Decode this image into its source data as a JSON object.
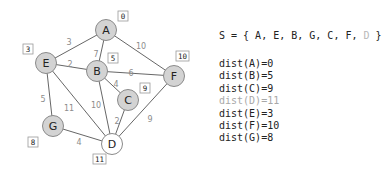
{
  "graph": {
    "nodes": [
      {
        "id": "A",
        "x": 106,
        "y": 30,
        "visited": true,
        "dist_label": "0",
        "lx": 118,
        "ly": 11
      },
      {
        "id": "E",
        "x": 46,
        "y": 63,
        "visited": true,
        "dist_label": "3",
        "lx": 23,
        "ly": 44
      },
      {
        "id": "B",
        "x": 97,
        "y": 71,
        "visited": true,
        "dist_label": "5",
        "lx": 108,
        "ly": 53
      },
      {
        "id": "F",
        "x": 174,
        "y": 76,
        "visited": true,
        "dist_label": "10",
        "lx": 176,
        "ly": 51
      },
      {
        "id": "C",
        "x": 128,
        "y": 100,
        "visited": true,
        "dist_label": "9",
        "lx": 140,
        "ly": 83
      },
      {
        "id": "G",
        "x": 53,
        "y": 126,
        "visited": true,
        "dist_label": "8",
        "lx": 28,
        "ly": 137
      },
      {
        "id": "D",
        "x": 112,
        "y": 144,
        "visited": false,
        "dist_label": "11",
        "lx": 93,
        "ly": 154
      }
    ],
    "edges": [
      {
        "from": "A",
        "to": "E",
        "weight": "3",
        "wx": 69,
        "wy": 42
      },
      {
        "from": "A",
        "to": "B",
        "weight": "7",
        "wx": 96,
        "wy": 54
      },
      {
        "from": "A",
        "to": "F",
        "weight": "10",
        "wx": 141,
        "wy": 46
      },
      {
        "from": "E",
        "to": "B",
        "weight": "2",
        "wx": 70,
        "wy": 64
      },
      {
        "from": "B",
        "to": "F",
        "weight": "6",
        "wx": 131,
        "wy": 73
      },
      {
        "from": "B",
        "to": "C",
        "weight": "4",
        "wx": 116,
        "wy": 84
      },
      {
        "from": "E",
        "to": "G",
        "weight": "5",
        "wx": 43,
        "wy": 99
      },
      {
        "from": "E",
        "to": "D",
        "weight": "11",
        "wx": 69,
        "wy": 108
      },
      {
        "from": "B",
        "to": "D",
        "weight": "10",
        "wx": 96,
        "wy": 105
      },
      {
        "from": "C",
        "to": "D",
        "weight": "2",
        "wx": 117,
        "wy": 121
      },
      {
        "from": "F",
        "to": "D",
        "weight": "9",
        "wx": 150,
        "wy": 119
      },
      {
        "from": "G",
        "to": "D",
        "weight": "4",
        "wx": 79,
        "wy": 142
      }
    ]
  },
  "panel": {
    "set_prefix": "S = { A, E, B, G, C, F, ",
    "set_pending": "D",
    "set_suffix": " }",
    "dists": [
      {
        "text": "dist(A)=0",
        "pending": false
      },
      {
        "text": "dist(B)=5",
        "pending": false
      },
      {
        "text": "dist(C)=9",
        "pending": false
      },
      {
        "text": "dist(D)=11",
        "pending": true
      },
      {
        "text": "dist(E)=3",
        "pending": false
      },
      {
        "text": "dist(F)=10",
        "pending": false
      },
      {
        "text": "dist(G)=8",
        "pending": false
      }
    ]
  },
  "colors": {
    "node_fill_visited": "#d3d3d3",
    "node_fill_pending": "#ffffff",
    "node_stroke": "#8a8a8a",
    "edge": "#555555",
    "weight_text": "#8c8c8c",
    "label_box_stroke": "#999999"
  }
}
